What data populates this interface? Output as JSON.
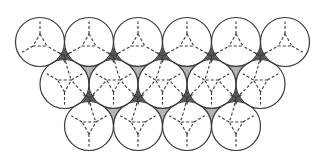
{
  "diagram": {
    "title": "",
    "radius": 24.5,
    "rows": [
      {
        "y": 42,
        "x": [
          40,
          89,
          138,
          187,
          236,
          285
        ]
      },
      {
        "y": 84,
        "x": [
          64.5,
          113.5,
          162.5,
          211.5,
          260.5
        ]
      },
      {
        "y": 126,
        "x": [
          89,
          138,
          187,
          236
        ]
      }
    ],
    "colors": {
      "background": "#ffffff",
      "outline": "#3a3a3a",
      "dark_void": "#5a5a5a",
      "light_void": "#b4b4b4"
    }
  }
}
